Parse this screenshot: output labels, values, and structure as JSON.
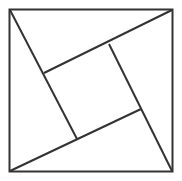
{
  "diagram": {
    "stroke_color": "#333333",
    "background": "#ffffff",
    "outer_square": {
      "x1": 9,
      "y1": 9,
      "x2": 173,
      "y2": 172
    },
    "inner_square": [
      [
        44,
        73
      ],
      [
        109,
        44
      ],
      [
        141,
        109
      ],
      [
        77,
        139
      ]
    ],
    "lines": [
      {
        "from": [
          9,
          9
        ],
        "to": [
          77,
          139
        ]
      },
      {
        "from": [
          172,
          9
        ],
        "to": [
          44,
          73
        ]
      },
      {
        "from": [
          173,
          172
        ],
        "to": [
          109,
          44
        ]
      },
      {
        "from": [
          10,
          172
        ],
        "to": [
          141,
          109
        ]
      }
    ]
  }
}
